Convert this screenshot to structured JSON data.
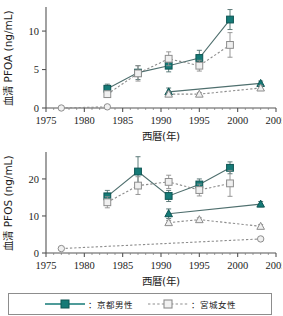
{
  "figure": {
    "title": "",
    "legend": {
      "entries": [
        {
          "label": "：京都男性",
          "marker": "filled-square",
          "line": "solid",
          "color": "#157a77"
        },
        {
          "label": "：宮城女性",
          "marker": "open-square",
          "line": "dotted",
          "color": "#a9a9a9"
        }
      ]
    }
  },
  "chart_data": [
    {
      "type": "line",
      "id": "pfoa",
      "title": "",
      "xlabel": "西暦(年)",
      "ylabel": "血清 PFOA (ng/mL)",
      "xlim": [
        1975,
        2005
      ],
      "ylim": [
        0,
        13
      ],
      "xticks": [
        1975,
        1980,
        1985,
        1990,
        1995,
        2000,
        2005
      ],
      "yticks": [
        0,
        5,
        10
      ],
      "grid": false,
      "legend_position": "below-figure",
      "series": [
        {
          "name": "京都男性",
          "marker": "filled-square",
          "line": "solid",
          "color": "#157a77",
          "x": [
            1983,
            1987,
            1991,
            1995,
            1999
          ],
          "values": [
            2.5,
            4.6,
            5.5,
            6.5,
            11.5
          ],
          "errors": [
            0.6,
            0.9,
            0.8,
            1.0,
            1.3
          ]
        },
        {
          "name": "宮城女性",
          "marker": "open-square",
          "line": "dotted",
          "color": "#a9a9a9",
          "x": [
            1983,
            1987,
            1991,
            1995,
            1999
          ],
          "values": [
            1.8,
            4.5,
            6.4,
            5.5,
            8.2
          ],
          "errors": [
            0.4,
            1.0,
            0.9,
            0.7,
            1.6
          ]
        },
        {
          "name": "京都(低値群)",
          "marker": "filled-triangle",
          "line": "solid",
          "color": "#157a77",
          "x": [
            1991,
            2003
          ],
          "values": [
            2.1,
            3.2
          ],
          "errors": [
            0.5,
            0.3
          ]
        },
        {
          "name": "宮城(低値群)",
          "marker": "open-triangle",
          "line": "dotted",
          "color": "#a9a9a9",
          "x": [
            1991,
            1995,
            2003
          ],
          "values": [
            1.8,
            1.8,
            2.6
          ],
          "errors": [
            0.3,
            0.2,
            0.3
          ]
        },
        {
          "name": "基準点",
          "marker": "open-circle",
          "line": "dotted",
          "color": "#a9a9a9",
          "x": [
            1977,
            1983
          ],
          "values": [
            0.0,
            0.15
          ],
          "errors": [
            0.0,
            0.0
          ]
        }
      ]
    },
    {
      "type": "line",
      "id": "pfos",
      "title": "",
      "xlabel": "西暦(年)",
      "ylabel": "血清 PFOS (ng/mL)",
      "xlim": [
        1975,
        2005
      ],
      "ylim": [
        0,
        27
      ],
      "xticks": [
        1975,
        1980,
        1985,
        1990,
        1995,
        2000,
        2005
      ],
      "yticks": [
        0,
        10,
        20
      ],
      "grid": false,
      "legend_position": "below-figure",
      "series": [
        {
          "name": "京都男性",
          "marker": "filled-square",
          "line": "solid",
          "color": "#157a77",
          "x": [
            1983,
            1987,
            1991,
            1995,
            1999
          ],
          "values": [
            15.3,
            22.0,
            15.4,
            18.5,
            23.0
          ],
          "errors": [
            1.6,
            4.0,
            1.5,
            1.5,
            1.6
          ]
        },
        {
          "name": "宮城女性",
          "marker": "open-square",
          "line": "dotted",
          "color": "#a9a9a9",
          "x": [
            1983,
            1987,
            1991,
            1995,
            1999
          ],
          "values": [
            13.7,
            18.2,
            19.2,
            17.0,
            18.8
          ],
          "errors": [
            1.5,
            2.4,
            1.8,
            1.6,
            3.5
          ]
        },
        {
          "name": "京都(低値群)",
          "marker": "filled-triangle",
          "line": "solid",
          "color": "#157a77",
          "x": [
            1991,
            2003
          ],
          "values": [
            10.6,
            13.2
          ],
          "errors": [
            1.3,
            0.7
          ]
        },
        {
          "name": "宮城(低値群)",
          "marker": "open-triangle",
          "line": "dotted",
          "color": "#a9a9a9",
          "x": [
            1991,
            1995,
            2003
          ],
          "values": [
            8.2,
            9.0,
            7.2
          ],
          "errors": [
            0.6,
            0.5,
            0.5
          ]
        },
        {
          "name": "基準点",
          "marker": "open-circle",
          "line": "dotted",
          "color": "#a9a9a9",
          "x": [
            1977,
            2003
          ],
          "values": [
            1.2,
            3.8
          ],
          "errors": [
            0.0,
            0.3
          ]
        }
      ]
    }
  ]
}
